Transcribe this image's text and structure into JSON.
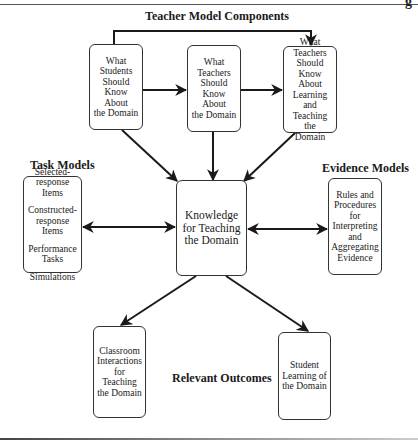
{
  "page": {
    "corner_glyph": "g"
  },
  "headings": {
    "teacher_model": "Teacher Model Components",
    "task_models": "Task Models",
    "evidence_models": "Evidence Models",
    "relevant_outcomes": "Relevant Outcomes"
  },
  "teacher_components": [
    {
      "label": "What\nStudents\nShould\nKnow About\nthe Domain"
    },
    {
      "label": "What\nTeachers\nShould\nKnow About\nthe Domain"
    },
    {
      "label": "What\nTeachers\nShould\nKnow About\nLearning and\nTeaching the\nDomain"
    }
  ],
  "center": {
    "label": "Knowledge\nfor Teaching\nthe Domain"
  },
  "task_models": {
    "items": [
      "Selected-\nresponse Items",
      "Constructed-\nresponse Items",
      "Performance\nTasks",
      "Simulations"
    ]
  },
  "evidence_models": {
    "label": "Rules and\nProcedures\nfor\nInterpreting\nand\nAggregating\nEvidence"
  },
  "outcomes": [
    {
      "label": "Classroom\nInteractions\nfor Teaching\nthe Domain"
    },
    {
      "label": "Student\nLearning of\nthe Domain"
    }
  ],
  "connections": [
    {
      "from": "component-1",
      "to": "component-2",
      "type": "arrow"
    },
    {
      "from": "component-2",
      "to": "component-3",
      "type": "arrow"
    },
    {
      "from": "component-1",
      "to": "component-3",
      "type": "arrow",
      "route": "over-top"
    },
    {
      "from": "component-1",
      "to": "center",
      "type": "arrow"
    },
    {
      "from": "component-2",
      "to": "center",
      "type": "arrow"
    },
    {
      "from": "component-3",
      "to": "center",
      "type": "arrow"
    },
    {
      "from": "task-models",
      "to": "center",
      "type": "bidirectional"
    },
    {
      "from": "center",
      "to": "evidence-models",
      "type": "bidirectional"
    },
    {
      "from": "center",
      "to": "outcome-classroom",
      "type": "arrow"
    },
    {
      "from": "center",
      "to": "outcome-student",
      "type": "arrow"
    }
  ],
  "colors": {
    "line": "#1a1a1a",
    "box_border": "#333333",
    "background": "#ffffff"
  }
}
